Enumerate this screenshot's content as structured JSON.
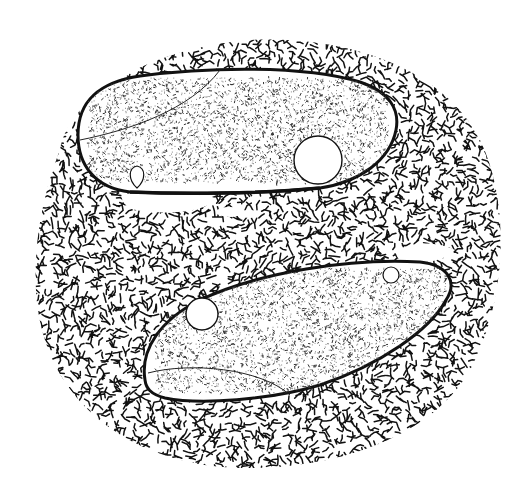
{
  "illustration": {
    "subject": "Two spindle-shaped cells embedded in a textured matrix",
    "style": "pen-and-ink stipple illustration",
    "colors": {
      "ink": "#111111",
      "background": "#ffffff",
      "cell_fill": "#ffffff"
    },
    "matrix": {
      "shape": "irregular rounded blob",
      "texture": "dense short squiggle strokes",
      "center": [
        270,
        255
      ],
      "radii": [
        245,
        215
      ]
    },
    "cells": [
      {
        "id": "upper-cell",
        "shape": "elongated spindle, blunt left end, tapered right end",
        "bbox": [
          78,
          70,
          398,
          192
        ],
        "texture": "fine stipple with short dashes",
        "inner_curve": "arc from upper-middle to left end",
        "vacuoles": [
          {
            "kind": "large",
            "cx": 318,
            "cy": 160,
            "r": 24
          },
          {
            "kind": "small teardrop",
            "cx": 137,
            "cy": 177,
            "r": 9
          }
        ]
      },
      {
        "id": "lower-cell",
        "shape": "elongated spindle tilted, blunt left end, tapered right end",
        "bbox": [
          143,
          262,
          455,
          402
        ],
        "texture": "fine stipple with short dashes",
        "inner_curve": "arc along lower-left margin",
        "vacuoles": [
          {
            "kind": "large",
            "cx": 202,
            "cy": 314,
            "r": 16
          },
          {
            "kind": "small",
            "cx": 391,
            "cy": 275,
            "r": 8
          }
        ]
      }
    ],
    "gaps": [
      {
        "kind": "clear channel below upper cell",
        "x": 125,
        "y": 193,
        "w": 85,
        "h": 20
      },
      {
        "kind": "clear patch right of lower cell",
        "x": 400,
        "y": 245,
        "w": 50,
        "h": 18
      }
    ]
  }
}
